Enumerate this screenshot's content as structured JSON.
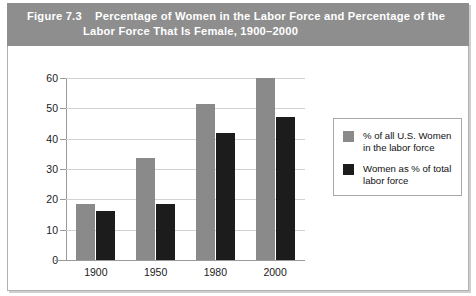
{
  "figure": {
    "label": "Figure 7.3",
    "title_line1": "Percentage of Women in the Labor Force and Percentage of the",
    "title_line2": "Labor Force That Is Female, 1900–2000",
    "band_color": "#8e8e8e",
    "band_text_color": "#ffffff"
  },
  "chart_data": {
    "type": "bar",
    "categories": [
      "1900",
      "1950",
      "1980",
      "2000"
    ],
    "series": [
      {
        "name": "% of all U.S. Women in the labor force",
        "color": "#8a8a8a",
        "values": [
          18.5,
          33.5,
          51.5,
          60
        ]
      },
      {
        "name": "Women as % of total labor force",
        "color": "#1c1c1c",
        "values": [
          16,
          18.5,
          42,
          47
        ]
      }
    ],
    "xlabel": "",
    "ylabel": "",
    "ylim": [
      0,
      60
    ],
    "yticks": [
      0,
      10,
      20,
      30,
      40,
      50,
      60
    ],
    "ytick_labels": [
      "0",
      "10",
      "20",
      "30",
      "40",
      "50",
      "60"
    ],
    "grid": true,
    "legend_position": "right"
  },
  "legend": {
    "entries": [
      {
        "label": "% of all U.S. Women in the labor force",
        "color": "#8a8a8a"
      },
      {
        "label": "Women as % of total labor force",
        "color": "#1c1c1c"
      }
    ]
  }
}
